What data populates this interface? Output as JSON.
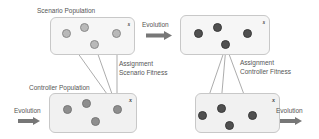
{
  "diagram": {
    "scenario_population": {
      "title": "Scenario Population",
      "variable": "s"
    },
    "controller_population": {
      "title": "Controller Population",
      "variable": "x"
    },
    "evolved_scenario": {
      "variable": "s"
    },
    "evolved_controller": {
      "variable": "x"
    },
    "evolution_label_top": "Evolution",
    "evolution_label_left": "Evolution",
    "evolution_label_right": "Evolution",
    "assignment_scenario": {
      "line1": "Assignment",
      "line2": "Scenario Fitness"
    },
    "assignment_controller": {
      "line1": "Assignment",
      "line2": "Controller Fitness"
    },
    "colors": {
      "box_border": "#c8c8c8",
      "box_fill": "#f1f1f1",
      "arrow": "#777777",
      "dot_light": "#b9b9b9",
      "dot_mid": "#8e8e8e",
      "dot_dark": "#505050",
      "line": "#888888"
    }
  }
}
